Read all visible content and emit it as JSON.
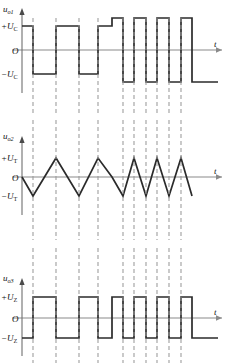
{
  "figure": {
    "title": "",
    "width": 234,
    "height": 363,
    "background": "#ffffff",
    "wave_color": "#2b2b2b",
    "axis_color": "#8a8a8a",
    "dash_color": "#9a9a9a"
  },
  "panels": [
    {
      "id": "panel-top",
      "signal_label": "u",
      "signal_sub": "o1",
      "axis_x_label": "t",
      "origin_label": "O",
      "pos_label": "+U",
      "pos_sub": "C",
      "neg_label": "−U",
      "neg_sub": "C",
      "wave_type": "square",
      "description": "comparator output square wave, variable duty, higher amplitude after x=98"
    },
    {
      "id": "panel-middle",
      "signal_label": "u",
      "signal_sub": "o2",
      "axis_x_label": "t",
      "origin_label": "O",
      "pos_label": "+U",
      "pos_sub": "T",
      "neg_label": "−U",
      "neg_sub": "T",
      "wave_type": "triangle",
      "description": "integrator output triangle wave, period shortens after x=98"
    },
    {
      "id": "panel-bottom",
      "signal_label": "u",
      "signal_sub": "o3",
      "axis_x_label": "t",
      "origin_label": "O",
      "pos_label": "+U",
      "pos_sub": "Z",
      "neg_label": "−U",
      "neg_sub": "Z",
      "wave_type": "square",
      "description": "zener-clamped square wave output"
    }
  ],
  "chart_data": {
    "type": "line",
    "xlabel": "t",
    "ylabel": "",
    "grid": false,
    "legend": null,
    "x_axis_px": [
      22,
      228
    ],
    "dashed_gridlines_px": [
      33,
      56,
      79,
      98,
      123,
      134,
      146,
      157,
      169,
      181
    ],
    "panels": [
      {
        "name": "u_o1",
        "baseline_y_px": 50,
        "levels_px": {
          "high": 26,
          "low": 74,
          "high2": 18,
          "low2": 82
        },
        "points_px": [
          [
            22,
            26
          ],
          [
            33,
            26
          ],
          [
            33,
            74
          ],
          [
            56,
            74
          ],
          [
            56,
            26
          ],
          [
            79,
            26
          ],
          [
            79,
            74
          ],
          [
            98,
            74
          ],
          [
            98,
            26
          ],
          [
            112,
            26
          ],
          [
            112,
            18
          ],
          [
            123,
            18
          ],
          [
            123,
            82
          ],
          [
            134,
            82
          ],
          [
            134,
            18
          ],
          [
            146,
            18
          ],
          [
            146,
            82
          ],
          [
            157,
            82
          ],
          [
            157,
            18
          ],
          [
            169,
            18
          ],
          [
            169,
            82
          ],
          [
            181,
            82
          ],
          [
            181,
            18
          ],
          [
            192,
            18
          ],
          [
            192,
            82
          ],
          [
            218,
            82
          ]
        ]
      },
      {
        "name": "u_o2",
        "baseline_y_px": 177,
        "levels_px": {
          "peak": 158,
          "trough": 196
        },
        "points_px": [
          [
            22,
            177
          ],
          [
            33,
            196
          ],
          [
            56,
            158
          ],
          [
            79,
            196
          ],
          [
            98,
            158
          ],
          [
            112,
            177
          ],
          [
            123,
            196
          ],
          [
            134,
            158
          ],
          [
            146,
            196
          ],
          [
            157,
            158
          ],
          [
            169,
            196
          ],
          [
            181,
            158
          ],
          [
            192,
            196
          ]
        ]
      },
      {
        "name": "u_o3",
        "baseline_y_px": 318,
        "levels_px": {
          "high": 297,
          "low": 338
        },
        "points_px": [
          [
            22,
            338
          ],
          [
            33,
            338
          ],
          [
            33,
            297
          ],
          [
            56,
            297
          ],
          [
            56,
            338
          ],
          [
            79,
            338
          ],
          [
            79,
            297
          ],
          [
            98,
            297
          ],
          [
            98,
            338
          ],
          [
            112,
            338
          ],
          [
            112,
            297
          ],
          [
            123,
            297
          ],
          [
            123,
            338
          ],
          [
            134,
            338
          ],
          [
            134,
            297
          ],
          [
            146,
            297
          ],
          [
            146,
            338
          ],
          [
            157,
            338
          ],
          [
            157,
            297
          ],
          [
            169,
            297
          ],
          [
            169,
            338
          ],
          [
            181,
            338
          ],
          [
            181,
            297
          ],
          [
            192,
            297
          ],
          [
            192,
            338
          ],
          [
            218,
            338
          ]
        ]
      }
    ]
  }
}
